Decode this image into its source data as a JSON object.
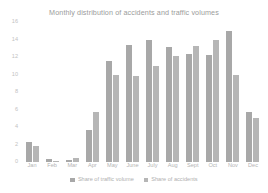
{
  "chart_data": {
    "type": "bar",
    "title": "Monthly distribution of accidents and traffic volumes",
    "xlabel": "",
    "ylabel": "",
    "ylim": [
      0,
      16
    ],
    "yticks": [
      0,
      2,
      4,
      6,
      8,
      10,
      12,
      14,
      16
    ],
    "grid": false,
    "legend_position": "bottom",
    "categories": [
      "Jan",
      "Feb",
      "Mar",
      "Apr",
      "May",
      "June",
      "July",
      "Aug",
      "Sept",
      "Oct",
      "Nov",
      "Dec"
    ],
    "series": [
      {
        "name": "Share of traffic volume",
        "color": "#a8a8a8",
        "values": [
          2.3,
          0.3,
          0.2,
          3.7,
          11.6,
          13.4,
          13.9,
          13.2,
          12.3,
          12.2,
          15.0,
          5.7
        ]
      },
      {
        "name": "Share of accidents",
        "color": "#b6b6b6",
        "values": [
          1.8,
          0.1,
          0.5,
          5.7,
          9.9,
          9.8,
          11.0,
          12.1,
          13.3,
          13.9,
          10.0,
          5.0
        ]
      }
    ]
  },
  "colors": {
    "title_text": "#9b9b9b",
    "tick_text": "#b8b8b8",
    "background": "#ffffff"
  }
}
